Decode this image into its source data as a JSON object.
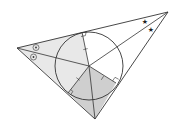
{
  "diagram": {
    "type": "geometry-incircle",
    "colors": {
      "background": "#ffffff",
      "stroke": "#333333",
      "light_fill": "#e6e6e6",
      "dark_fill": "#cfcfcf"
    },
    "vertices": {
      "A": [
        17,
        48
      ],
      "B": [
        168,
        12
      ],
      "C": [
        95,
        119
      ]
    },
    "incenter": [
      89,
      66
    ],
    "incircle": {
      "cx": 89,
      "cy": 66,
      "r": 34
    },
    "tangent_points": {
      "on_AB": [
        82,
        32
      ],
      "on_BC": [
        116,
        83
      ],
      "on_AC": [
        68,
        93
      ]
    },
    "angle_marks": {
      "A": "dotted-circle",
      "B": "star"
    },
    "labels": []
  }
}
